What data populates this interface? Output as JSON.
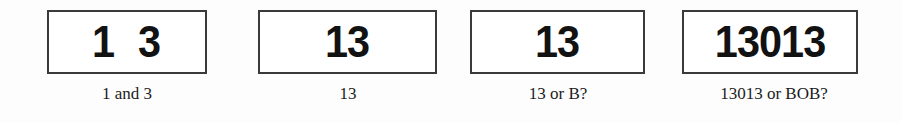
{
  "figure": {
    "background_color": "#fdfdfd",
    "box_border_color": "#3a3a3a",
    "box_fill_color": "#ffffff",
    "glyph_color": "#121212",
    "caption_color": "#1c1c1c"
  },
  "panels": [
    {
      "glyphs": "1  3",
      "caption": "1 and 3"
    },
    {
      "glyphs": "13",
      "caption": "13"
    },
    {
      "glyphs": "13",
      "caption": "13 or B?"
    },
    {
      "glyphs": "13013",
      "caption": "13013 or BOB?"
    }
  ]
}
